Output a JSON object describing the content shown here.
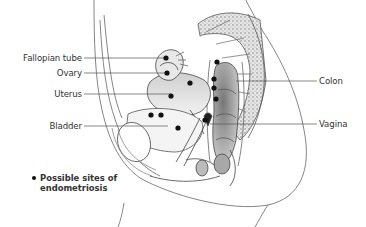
{
  "diagram": {
    "type": "anatomical-cross-section",
    "labels_left": [
      {
        "text": "Fallopian tube",
        "y": 58
      },
      {
        "text": "Ovary",
        "y": 73
      },
      {
        "text": "Uterus",
        "y": 94
      },
      {
        "text": "Bladder",
        "y": 126
      }
    ],
    "labels_right": [
      {
        "text": "Colon",
        "y": 81
      },
      {
        "text": "Vagina",
        "y": 124
      }
    ],
    "legend": {
      "marker": "dot",
      "line1": "Possible sites of",
      "line2": "endometriosis"
    },
    "sites": [
      {
        "x": 166,
        "y": 58
      },
      {
        "x": 167,
        "y": 73
      },
      {
        "x": 190,
        "y": 83
      },
      {
        "x": 171,
        "y": 96
      },
      {
        "x": 151,
        "y": 115
      },
      {
        "x": 161,
        "y": 115
      },
      {
        "x": 178,
        "y": 128
      },
      {
        "x": 217,
        "y": 62
      },
      {
        "x": 214,
        "y": 79
      },
      {
        "x": 214,
        "y": 88
      },
      {
        "x": 216,
        "y": 99
      },
      {
        "x": 205,
        "y": 120
      }
    ],
    "colors": {
      "line": "#555555",
      "dot": "#111111",
      "text": "#333333",
      "bone_fill": "#d8d8d8",
      "organ_shade": "#9a9a9a"
    }
  }
}
